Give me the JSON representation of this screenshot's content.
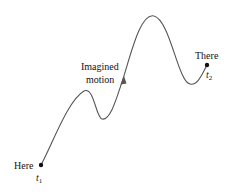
{
  "diagram": {
    "type": "trajectory",
    "labels": {
      "start": "Here",
      "start_time": "t",
      "start_time_sub": "1",
      "path_label_line1": "Imagined",
      "path_label_line2": "motion",
      "end": "There",
      "end_time": "t",
      "end_time_sub": "2"
    },
    "colors": {
      "curve": "#555555",
      "points": "#111111",
      "text": "#111111"
    }
  }
}
